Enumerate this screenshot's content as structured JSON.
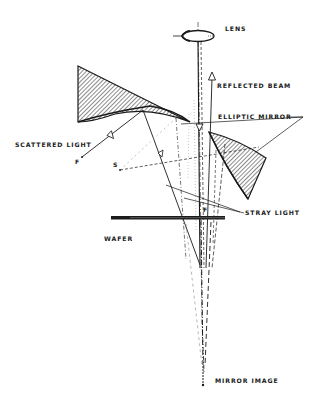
{
  "diagram": {
    "type": "optical schematic",
    "labels": {
      "lens": "LENS",
      "reflected_beam": "REFLECTED BEAM",
      "elliptic_mirror": "ELLIPTIC MIRROR",
      "scattered_light": "SCATTERED LIGHT",
      "stray_light": "STRAY LIGHT",
      "wafer": "WAFER",
      "mirror_image": "MIRROR IMAGE"
    },
    "points": {
      "focus_upper": "F",
      "focus_wafer": "F",
      "source": "S"
    },
    "colors": {
      "ink": "#1a1a1a",
      "background": "#ffffff",
      "faint": "#9a9a9a"
    }
  }
}
